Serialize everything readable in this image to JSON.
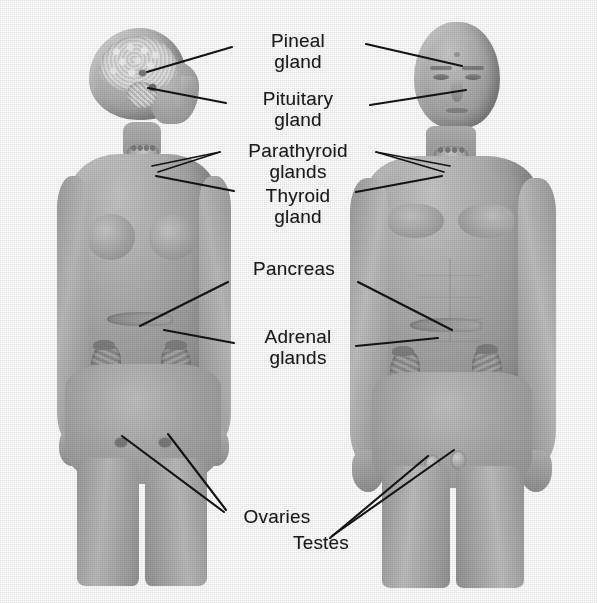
{
  "diagram": {
    "background_color": "#ffffff",
    "ink_color": "#141414",
    "skin_color": "#a8a8a8",
    "figures": [
      {
        "id": "female-figure",
        "name": "Female figure",
        "side": "left",
        "view": "anterior body with head in right profile and brain cutaway"
      },
      {
        "id": "male-figure",
        "name": "Male figure",
        "side": "right",
        "view": "anterior body with front-facing head"
      }
    ],
    "labels": [
      {
        "id": "pineal-gland",
        "text": "Pineal\ngland",
        "x": 236,
        "y": 30,
        "w": 124
      },
      {
        "id": "pituitary-gland",
        "text": "Pituitary\ngland",
        "x": 230,
        "y": 88,
        "w": 136
      },
      {
        "id": "parathyroid-glands",
        "text": "Parathyroid\nglands",
        "x": 222,
        "y": 140,
        "w": 152
      },
      {
        "id": "thyroid-gland",
        "text": "Thyroid\ngland",
        "x": 238,
        "y": 185,
        "w": 120
      },
      {
        "id": "pancreas",
        "text": "Pancreas",
        "x": 232,
        "y": 258,
        "w": 124
      },
      {
        "id": "adrenal-glands",
        "text": "Adrenal\nglands",
        "x": 238,
        "y": 326,
        "w": 120
      },
      {
        "id": "ovaries",
        "text": "Ovaries",
        "x": 222,
        "y": 506,
        "w": 110
      },
      {
        "id": "testes",
        "text": "Testes",
        "x": 268,
        "y": 532,
        "w": 106
      }
    ],
    "organs": [
      {
        "id": "brain",
        "name": "Brain cutaway (female head)"
      },
      {
        "id": "pineal-body",
        "name": "Pineal gland"
      },
      {
        "id": "pituitary-body",
        "name": "Pituitary gland"
      },
      {
        "id": "thyroid-body",
        "name": "Thyroid gland"
      },
      {
        "id": "parathyroid-body",
        "name": "Parathyroid glands"
      },
      {
        "id": "pancreas-body",
        "name": "Pancreas"
      },
      {
        "id": "kidney-left",
        "name": "Left kidney with adrenal gland"
      },
      {
        "id": "kidney-right",
        "name": "Right kidney with adrenal gland"
      },
      {
        "id": "ovary-left",
        "name": "Left ovary"
      },
      {
        "id": "ovary-right",
        "name": "Right ovary"
      },
      {
        "id": "testis-left",
        "name": "Left testis"
      },
      {
        "id": "testis-right",
        "name": "Right testis"
      }
    ]
  }
}
